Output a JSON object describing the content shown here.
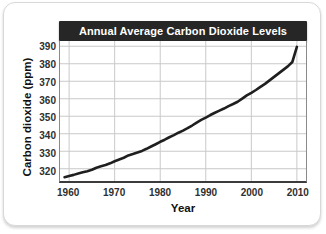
{
  "chart_data": {
    "type": "line",
    "title": "Annual Average Carbon Dioxide Levels",
    "xlabel": "Year",
    "ylabel": "Carbon dioxide (ppm)",
    "xlim": [
      1958,
      2012
    ],
    "ylim": [
      313,
      393
    ],
    "xticks": [
      1960,
      1970,
      1980,
      1990,
      2000,
      2010
    ],
    "xtick_labels": [
      "1960",
      "1970",
      "1980",
      "1990",
      "2000",
      "2010"
    ],
    "yticks": [
      320,
      330,
      340,
      350,
      360,
      370,
      380,
      390
    ],
    "ytick_labels": [
      "320",
      "330",
      "340",
      "350",
      "360",
      "370",
      "380",
      "390"
    ],
    "grid": true,
    "legend": false,
    "line_color": "#1f1f1f",
    "line_width": 2.6,
    "grid_color": "#c9c9c9",
    "title_bar_color": "#262626",
    "title_text_color": "#ffffff",
    "series": [
      {
        "name": "Annual average CO2",
        "x": [
          1959,
          1960,
          1961,
          1962,
          1963,
          1964,
          1965,
          1966,
          1967,
          1968,
          1969,
          1970,
          1971,
          1972,
          1973,
          1974,
          1975,
          1976,
          1977,
          1978,
          1979,
          1980,
          1981,
          1982,
          1983,
          1984,
          1985,
          1986,
          1987,
          1988,
          1989,
          1990,
          1991,
          1992,
          1993,
          1994,
          1995,
          1996,
          1997,
          1998,
          1999,
          2000,
          2001,
          2002,
          2003,
          2004,
          2005,
          2006,
          2007,
          2008,
          2009,
          2010
        ],
        "y": [
          315.2,
          315.9,
          316.5,
          317.3,
          318.0,
          318.6,
          319.4,
          320.6,
          321.4,
          322.1,
          323.1,
          324.3,
          325.3,
          326.3,
          327.6,
          328.4,
          329.3,
          330.2,
          331.4,
          332.7,
          334.0,
          335.4,
          336.6,
          338.0,
          339.2,
          340.6,
          341.8,
          343.2,
          344.7,
          346.4,
          347.9,
          349.2,
          350.7,
          352.0,
          353.2,
          354.4,
          355.8,
          357.0,
          358.3,
          360.1,
          361.9,
          363.4,
          365.0,
          366.8,
          368.5,
          370.5,
          372.5,
          374.5,
          376.5,
          378.5,
          381.0,
          389.6
        ]
      }
    ]
  }
}
